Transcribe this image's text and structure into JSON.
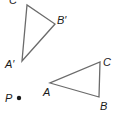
{
  "diagram": {
    "type": "geometry-transformation",
    "stroke_color": "#6b6b6b",
    "label_color": "#1a1a1a",
    "triangle_image": {
      "vertices": {
        "A_prime": {
          "label": "A′",
          "x": 22,
          "y": 61
        },
        "B_prime": {
          "label": "B′",
          "x": 55,
          "y": 24
        },
        "C_prime": {
          "label": "C′",
          "x": 27,
          "y": 5
        }
      }
    },
    "triangle_original": {
      "vertices": {
        "A": {
          "label": "A",
          "x": 50,
          "y": 83
        },
        "B": {
          "label": "B",
          "x": 99,
          "y": 97
        },
        "C": {
          "label": "C",
          "x": 100,
          "y": 62
        }
      }
    },
    "point_P": {
      "label": "P",
      "x": 20,
      "y": 98
    }
  }
}
